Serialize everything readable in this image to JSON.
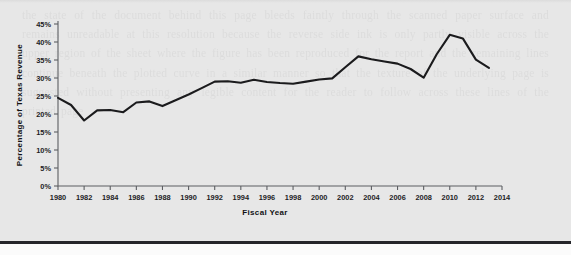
{
  "figure": {
    "background_color": "#e7e7e7",
    "line_color": "#1b1b1d",
    "axis_color": "#5d5f63",
    "text_color": "#1d1d1f"
  },
  "chart_data": {
    "type": "line",
    "title": "",
    "xlabel": "Fiscal Year",
    "ylabel": "Percentage of Texas Revenue",
    "xlim": [
      1980,
      2014
    ],
    "ylim": [
      0,
      45
    ],
    "grid": false,
    "legend": null,
    "x_tick_labels": [
      "1980",
      "1982",
      "1984",
      "1986",
      "1988",
      "1990",
      "1992",
      "1994",
      "1996",
      "1998",
      "2000",
      "2002",
      "2004",
      "2006",
      "2008",
      "2010",
      "2012",
      "2014"
    ],
    "x_ticks": [
      1980,
      1982,
      1984,
      1986,
      1988,
      1990,
      1992,
      1994,
      1996,
      1998,
      2000,
      2002,
      2004,
      2006,
      2008,
      2010,
      2012,
      2014
    ],
    "y_tick_labels": [
      "0%",
      "5%",
      "10%",
      "15%",
      "20%",
      "25%",
      "30%",
      "35%",
      "40%",
      "45%"
    ],
    "y_ticks": [
      0,
      5,
      10,
      15,
      20,
      25,
      30,
      35,
      40,
      45
    ],
    "x": [
      1980,
      1981,
      1982,
      1983,
      1984,
      1985,
      1986,
      1987,
      1988,
      1989,
      1990,
      1991,
      1992,
      1993,
      1994,
      1995,
      1996,
      1997,
      1998,
      1999,
      2000,
      2001,
      2002,
      2003,
      2004,
      2005,
      2006,
      2007,
      2008,
      2009,
      2010,
      2011,
      2012,
      2013
    ],
    "values": [
      24.5,
      22.5,
      18.2,
      21.0,
      21.1,
      20.5,
      23.2,
      23.5,
      22.2,
      23.8,
      25.4,
      27.2,
      29.0,
      29.1,
      28.7,
      29.5,
      28.9,
      28.6,
      28.4,
      29.0,
      29.6,
      29.9,
      33.0,
      36.0,
      35.2,
      34.6,
      34.0,
      32.5,
      30.1,
      36.6,
      42.0,
      41.0,
      35.1,
      32.8
    ],
    "series": [
      {
        "name": "Percentage of Texas Revenue",
        "values": [
          24.5,
          22.5,
          18.2,
          21.0,
          21.1,
          20.5,
          23.2,
          23.5,
          22.2,
          23.8,
          25.4,
          27.2,
          29.0,
          29.1,
          28.7,
          29.5,
          28.9,
          28.6,
          28.4,
          29.0,
          29.6,
          29.9,
          33.0,
          36.0,
          35.2,
          34.6,
          34.0,
          32.5,
          30.1,
          36.6,
          42.0,
          41.0,
          35.1,
          32.8
        ]
      }
    ]
  },
  "page": {
    "show_through_text": "the state of the document behind this page bleeds faintly through the scanned paper surface and remains unreadable at this resolution because the reverse side ink is only partly visible across the upper region of the sheet where the figure has been reproduced for the report and the remaining lines continue beneath the plotted curve in a similar manner so that the texture of the underlying page is suggested without presenting any legible content for the reader to follow across these lines of the printed page"
  }
}
